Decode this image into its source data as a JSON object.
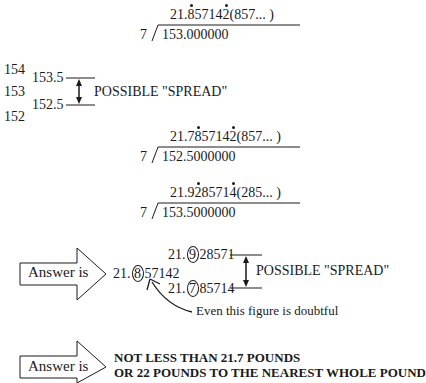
{
  "division_1": {
    "divisor": "7",
    "dividend": "153.000000",
    "q_int": "21.",
    "q_d1": "8",
    "q_mid": "5714",
    "q_d2": "2",
    "q_tail": "(857... )"
  },
  "scale": {
    "ticks": [
      "154",
      "153",
      "152"
    ],
    "upper": "153.5",
    "lower": "152.5",
    "spread_label": "POSSIBLE \"SPREAD\""
  },
  "division_2": {
    "divisor": "7",
    "dividend": "152.5000000",
    "q_int": "21.7",
    "q_d1": "8",
    "q_mid": "5714",
    "q_d2": "2",
    "q_tail": "(857... )"
  },
  "division_3": {
    "divisor": "7",
    "dividend": "153.5000000",
    "q_int": "21.9",
    "q_d1": "2",
    "q_mid": "8571",
    "q_d2": "4",
    "q_tail": "(285... )"
  },
  "answer_1": {
    "arrow_label": "Answer is",
    "value_int": "21.",
    "value_circled": "8",
    "value_rest": "57142",
    "upper_int": "21.",
    "upper_circled": "9",
    "upper_rest": "28571",
    "lower_int": "21.",
    "lower_circled": "7",
    "lower_rest": "85714",
    "spread_label": "POSSIBLE \"SPREAD\"",
    "note": "Even this figure is doubtful"
  },
  "answer_2": {
    "arrow_label": "Answer is",
    "line1": "NOT LESS THAN 21.7 POUNDS",
    "line2": "OR 22 POUNDS TO THE NEAREST WHOLE POUND"
  }
}
